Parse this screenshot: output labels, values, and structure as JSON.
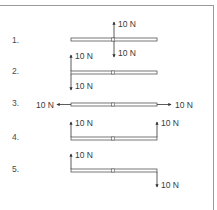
{
  "diagram": {
    "title": "",
    "bar": {
      "x1": 71,
      "x2": 157,
      "height": 3,
      "center_x": 113,
      "color": "#555555"
    },
    "rows": [
      {
        "label": "1.",
        "label_y": 43,
        "bar_y": 38,
        "forces": [
          {
            "dir": "up",
            "x": 114,
            "y_from": 38,
            "y_to": 22,
            "text": "10 N",
            "tx": 118,
            "ty": 27
          },
          {
            "dir": "down",
            "x": 114,
            "y_from": 41,
            "y_to": 57,
            "text": "10 N",
            "tx": 118,
            "ty": 56
          }
        ]
      },
      {
        "label": "2.",
        "label_y": 74,
        "bar_y": 71,
        "forces": [
          {
            "dir": "up",
            "x": 71,
            "y_from": 71,
            "y_to": 55,
            "text": "10 N",
            "tx": 75,
            "ty": 59
          },
          {
            "dir": "down",
            "x": 71,
            "y_from": 74,
            "y_to": 90,
            "text": "10 N",
            "tx": 75,
            "ty": 89
          }
        ]
      },
      {
        "label": "3.",
        "label_y": 106,
        "bar_y": 103,
        "forces": [
          {
            "dir": "left",
            "y": 104.5,
            "x_from": 71,
            "x_to": 57,
            "text": "10 N",
            "tx": 36,
            "ty": 108
          },
          {
            "dir": "right",
            "y": 104.5,
            "x_from": 157,
            "x_to": 171,
            "text": "10 N",
            "tx": 175,
            "ty": 108
          }
        ]
      },
      {
        "label": "4.",
        "label_y": 140,
        "bar_y": 137,
        "forces": [
          {
            "dir": "up",
            "x": 71,
            "y_from": 137,
            "y_to": 122,
            "text": "10 N",
            "tx": 75,
            "ty": 126
          },
          {
            "dir": "up",
            "x": 157,
            "y_from": 137,
            "y_to": 122,
            "text": "10 N",
            "tx": 161,
            "ty": 126
          }
        ]
      },
      {
        "label": "5.",
        "label_y": 172,
        "bar_y": 169,
        "forces": [
          {
            "dir": "up",
            "x": 71,
            "y_from": 169,
            "y_to": 154,
            "text": "10 N",
            "tx": 75,
            "ty": 158
          },
          {
            "dir": "down",
            "x": 157,
            "y_from": 172,
            "y_to": 187,
            "text": "10 N",
            "tx": 161,
            "ty": 188
          }
        ]
      }
    ]
  }
}
